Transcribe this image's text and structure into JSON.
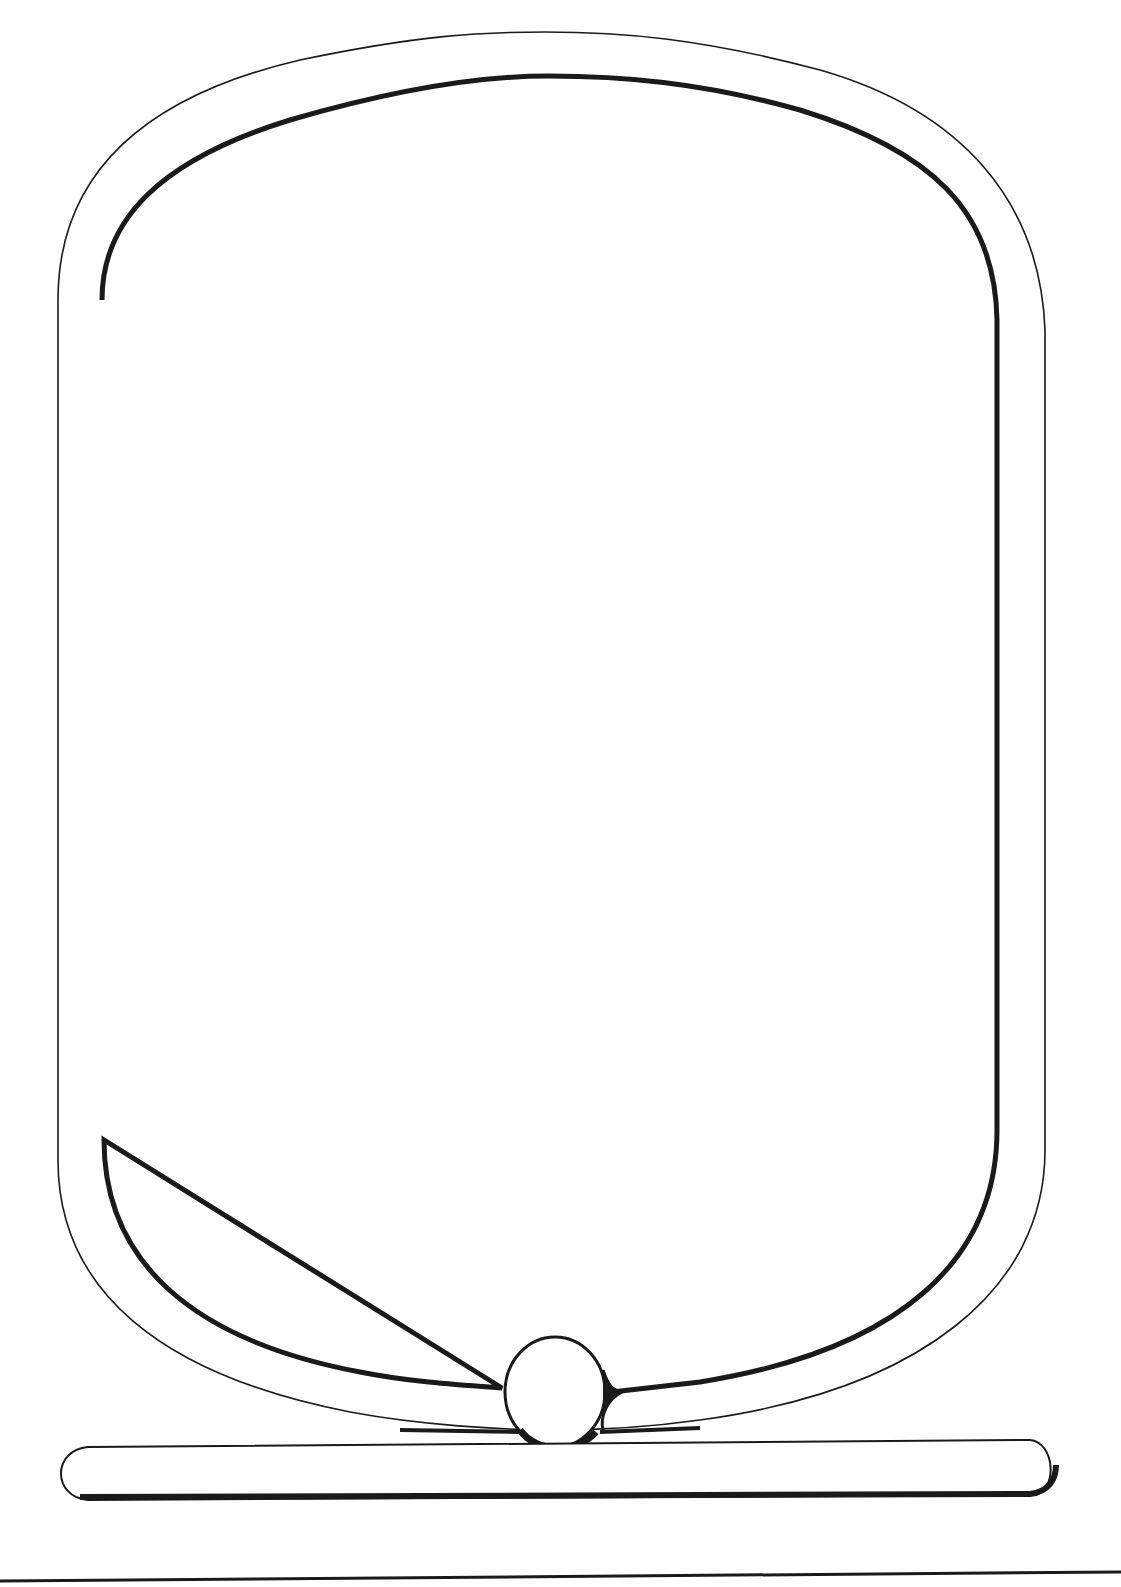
{
  "figure": {
    "colors": {
      "ink": "#1a1a1a",
      "paper": "#ffffff"
    },
    "parts": [
      "outer-outline",
      "inner-outline",
      "knot-circle",
      "base-bar",
      "bottom-rule"
    ]
  }
}
